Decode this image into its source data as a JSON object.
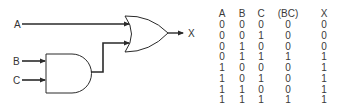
{
  "diagram": {
    "inputs": [
      {
        "label": "A"
      },
      {
        "label": "B"
      },
      {
        "label": "C"
      }
    ],
    "gates": [
      {
        "type": "AND",
        "inputs": [
          "B",
          "C"
        ],
        "output": "BC"
      },
      {
        "type": "OR",
        "inputs": [
          "A",
          "BC"
        ],
        "output": "X"
      }
    ],
    "output": {
      "label": "X"
    },
    "colors": {
      "stroke": "#2a2a2a",
      "text": "#333333",
      "background": "#ffffff"
    }
  },
  "truth_table": {
    "headers": [
      "A",
      "B",
      "C",
      "(BC)",
      "X"
    ],
    "rows": [
      [
        "0",
        "0",
        "0",
        "0",
        "0"
      ],
      [
        "0",
        "0",
        "1",
        "0",
        "0"
      ],
      [
        "0",
        "1",
        "0",
        "0",
        "0"
      ],
      [
        "0",
        "1",
        "1",
        "1",
        "1"
      ],
      [
        "1",
        "0",
        "0",
        "0",
        "1"
      ],
      [
        "1",
        "0",
        "1",
        "0",
        "1"
      ],
      [
        "1",
        "1",
        "0",
        "0",
        "1"
      ],
      [
        "1",
        "1",
        "1",
        "1",
        "1"
      ]
    ]
  }
}
